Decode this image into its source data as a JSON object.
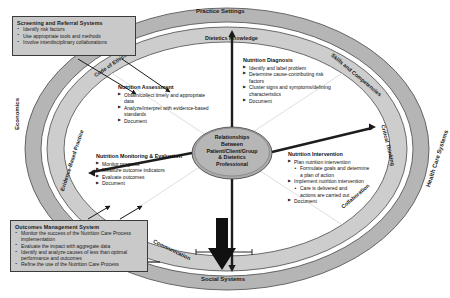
{
  "diagram": {
    "center": {
      "lines": [
        "Relationships",
        "Between",
        "Patient/Client/Group",
        "& Dietetics",
        "Professional"
      ]
    },
    "outer_ring": {
      "label": "Supportive Systems Ring",
      "items": [
        {
          "name": "practice-settings",
          "label": "Practice Settings"
        },
        {
          "name": "health-care-systems",
          "label": "Health Care Systems"
        },
        {
          "name": "social-systems",
          "label": "Social Systems"
        },
        {
          "name": "economics",
          "label": "Economics"
        }
      ]
    },
    "inner_ring": {
      "label": "Dietetics Professional Strengths Ring",
      "items": [
        {
          "name": "dietetics-knowledge",
          "label": "Dietetics Knowledge"
        },
        {
          "name": "skills-and-competencies",
          "label": "Skills and Competencies"
        },
        {
          "name": "critical-thinking",
          "label": "Critical Thinking"
        },
        {
          "name": "collaboration",
          "label": "Collaboration"
        },
        {
          "name": "communication",
          "label": "Communication"
        },
        {
          "name": "evidence-based-practice",
          "label": "Evidence-Based Practice"
        },
        {
          "name": "code-of-ethics",
          "label": "Code of Ethics"
        }
      ]
    },
    "steps": [
      {
        "name": "nutrition-assessment",
        "title": "Nutrition Assessment",
        "bullets": [
          {
            "text": "Obtain/collect timely and appropriate",
            "level": 1
          },
          {
            "text": "data",
            "level": 1,
            "cont": true
          },
          {
            "text": "Analyze/interpret with evidence-based",
            "level": 1
          },
          {
            "text": "standards",
            "level": 1,
            "cont": true
          },
          {
            "text": "Document",
            "level": 1
          }
        ]
      },
      {
        "name": "nutrition-diagnosis",
        "title": "Nutrition Diagnosis",
        "bullets": [
          {
            "text": "Identify and label problem",
            "level": 1
          },
          {
            "text": "Determine cause-contributing risk",
            "level": 1
          },
          {
            "text": "factors",
            "level": 1,
            "cont": true
          },
          {
            "text": "Cluster signs and symptoms/defining",
            "level": 1
          },
          {
            "text": "characteristics",
            "level": 1,
            "cont": true
          },
          {
            "text": "Document",
            "level": 1
          }
        ]
      },
      {
        "name": "nutrition-intervention",
        "title": "Nutrition Intervention",
        "bullets": [
          {
            "text": "Plan nutrition intervention",
            "level": 1
          },
          {
            "text": "Formulate goals and determine",
            "level": 2
          },
          {
            "text": "a plan of action",
            "level": 2,
            "cont": true
          },
          {
            "text": "Implement nutrition intervention",
            "level": 1
          },
          {
            "text": "Care is delivered and",
            "level": 2
          },
          {
            "text": "actions are carried out",
            "level": 2,
            "cont": true
          },
          {
            "text": "Document",
            "level": 1
          }
        ]
      },
      {
        "name": "nutrition-monitoring-evaluation",
        "title": "Nutrition Monitoring & Evaluation",
        "bullets": [
          {
            "text": "Monitor progress",
            "level": 1
          },
          {
            "text": "Measure outcome indicators",
            "level": 1
          },
          {
            "text": "Evaluate outcomes",
            "level": 1
          },
          {
            "text": "Document",
            "level": 1
          }
        ]
      }
    ],
    "callouts": [
      {
        "name": "screening-and-referral-systems",
        "title": "Screening and Referral Systems",
        "bullets": [
          "Identify risk factors",
          "Use appropriate tools and methods",
          "Involve interdisciplinary collaborations"
        ]
      },
      {
        "name": "outcomes-management-system",
        "title": "Outcomes Management System",
        "bullets": [
          "Monitor the success of the Nutrition Care Process implementation",
          "Evaluate the impact with aggregate data",
          "Identify and analyze causes of less than optimal performance and outcomes",
          "Refine the use of the Nutrition Care Process"
        ]
      }
    ],
    "colors": {
      "outer_ring": "#b7b7b7",
      "inner_ring": "#cfcfcf",
      "center_hub": "#b0b0b0",
      "callout_fill": "#c9c9c9",
      "stroke": "#3b3b3b",
      "background": "#ffffff"
    }
  }
}
